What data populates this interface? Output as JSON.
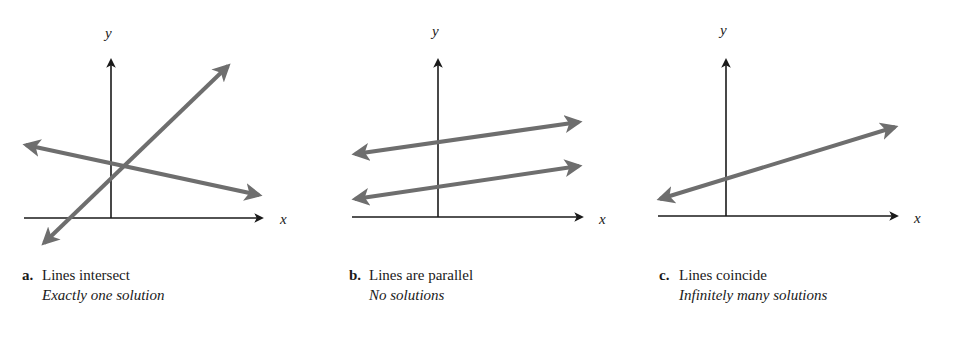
{
  "colors": {
    "axis": "#1a1a1a",
    "line": "#6e6e6e",
    "background": "#ffffff"
  },
  "panels": [
    {
      "letter": "a.",
      "title": "Lines intersect",
      "subtitle": "Exactly one solution",
      "x_label": "x",
      "y_label": "y"
    },
    {
      "letter": "b.",
      "title": "Lines are parallel",
      "subtitle": "No solutions",
      "x_label": "x",
      "y_label": "y"
    },
    {
      "letter": "c.",
      "title": "Lines coincide",
      "subtitle": "Infinitely many solutions",
      "x_label": "x",
      "y_label": "y"
    }
  ]
}
